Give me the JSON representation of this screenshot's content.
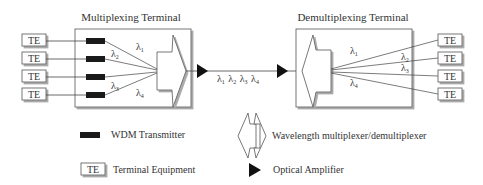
{
  "diagram": {
    "mux_terminal": {
      "title": "Multiplexing Terminal",
      "te_labels": [
        "TE",
        "TE",
        "TE",
        "TE"
      ],
      "channels": [
        {
          "symbol": "λ",
          "sub": "1"
        },
        {
          "symbol": "λ",
          "sub": "2"
        },
        {
          "symbol": "λ",
          "sub": "3"
        },
        {
          "symbol": "λ",
          "sub": "4"
        }
      ]
    },
    "link": {
      "label": [
        {
          "symbol": "λ",
          "sub": "1"
        },
        {
          "symbol": "λ",
          "sub": "2"
        },
        {
          "symbol": "λ",
          "sub": "3"
        },
        {
          "symbol": "λ",
          "sub": "4"
        }
      ]
    },
    "demux_terminal": {
      "title": "Demultiplexing Terminal",
      "te_labels": [
        "TE",
        "TE",
        "TE",
        "TE"
      ],
      "channels": [
        {
          "symbol": "λ",
          "sub": "1"
        },
        {
          "symbol": "λ",
          "sub": "2"
        },
        {
          "symbol": "λ",
          "sub": "3"
        },
        {
          "symbol": "λ",
          "sub": "4"
        }
      ]
    },
    "legend": {
      "wdm_transmitter": "WDM Transmitter",
      "te_box": "TE",
      "terminal_equipment": "Terminal Equipment",
      "mux_demux": "Wavelength multiplexer/demultiplexer",
      "optical_amplifier": "Optical Amplifier"
    },
    "colors": {
      "line": "#444444",
      "transmitter": "#1a1a1a",
      "box_shadow": "#bbbbbb",
      "amplifier": "#111111"
    }
  }
}
